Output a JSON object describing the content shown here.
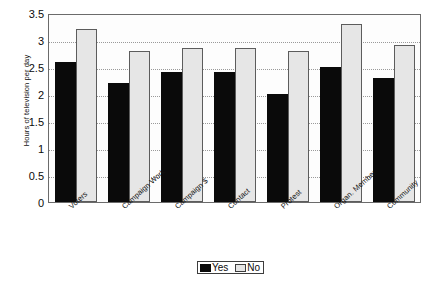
{
  "chart_data": {
    "type": "bar",
    "title": "",
    "xlabel": "",
    "ylabel": "Hours of television per day",
    "ylim": [
      0,
      3.5
    ],
    "ytick_labels": [
      "3.5",
      "3",
      "2.5",
      "2",
      "1.5",
      "1",
      "0.5",
      "0"
    ],
    "ytick_values": [
      3.5,
      3,
      2.5,
      2,
      1.5,
      1,
      0.5,
      0
    ],
    "grid": true,
    "legend_position": "bottom-center",
    "categories": [
      "Voters",
      "Campaign Work",
      "Campaign $",
      "Contact",
      "Protest",
      "Organ. Member",
      "Community"
    ],
    "series": [
      {
        "name": "Yes",
        "color": "#0a0a0a",
        "fill": "solid-black",
        "values": [
          2.6,
          2.2,
          2.4,
          2.4,
          2.0,
          2.5,
          2.3
        ]
      },
      {
        "name": "No",
        "color": "#e6e6e6",
        "fill": "dotted-pattern",
        "values": [
          3.2,
          2.8,
          2.85,
          2.85,
          2.8,
          3.3,
          2.9
        ]
      }
    ]
  },
  "legend": {
    "entries": [
      {
        "label": "Yes",
        "swatch": "solid-black-swatch"
      },
      {
        "label": "No",
        "swatch": "dotted-pattern-swatch"
      }
    ]
  }
}
